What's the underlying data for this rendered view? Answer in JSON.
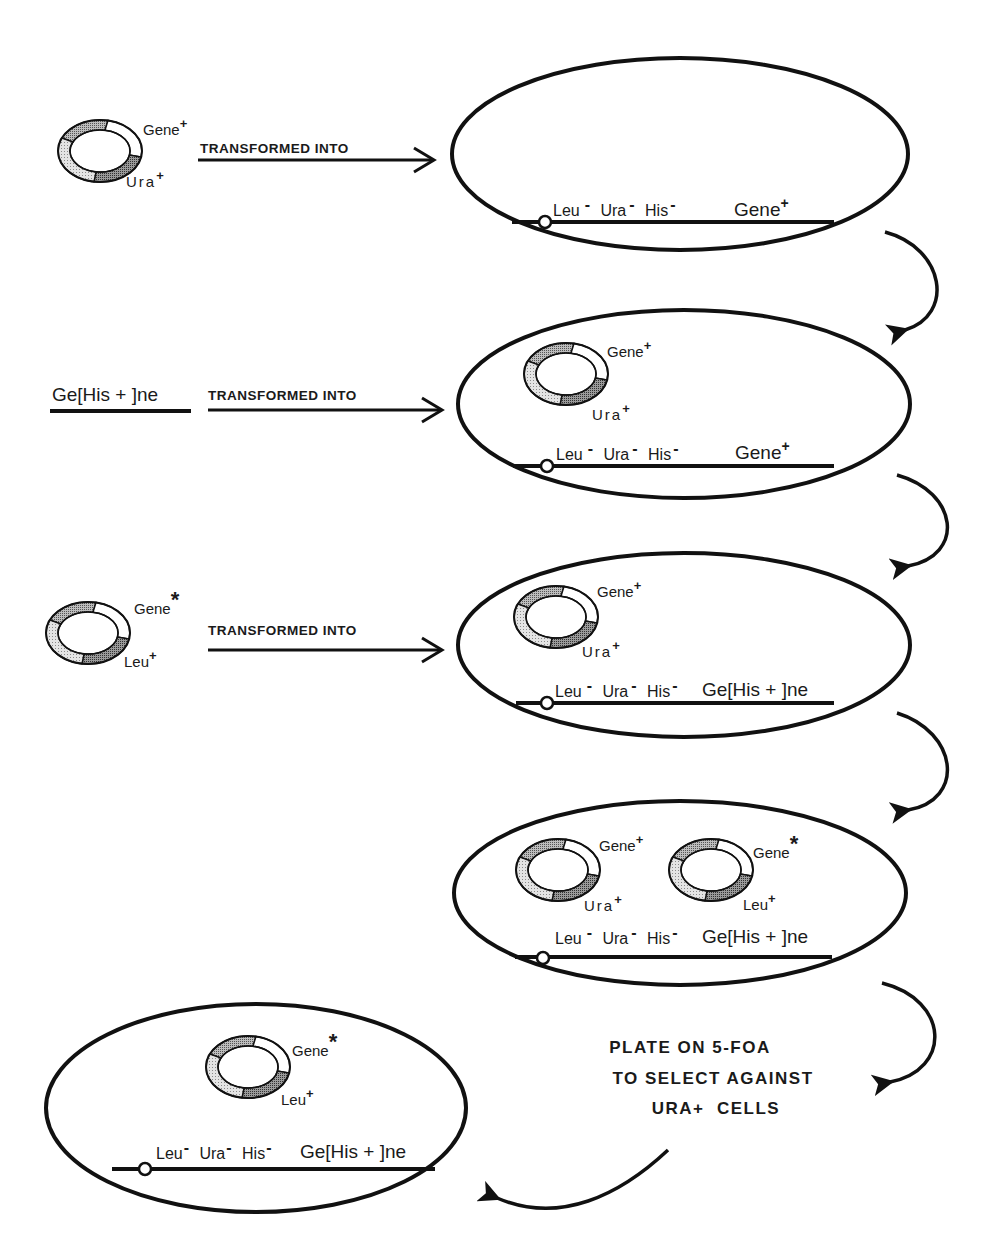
{
  "diagram": {
    "colors": {
      "ink": "#111111",
      "background": "#ffffff",
      "stipple_light": "#cfcfcf",
      "stipple_dark": "#6a6a6a"
    },
    "steps": [
      {
        "id": "step1",
        "input": {
          "type": "plasmid",
          "labels": {
            "top": "Gene",
            "top_sup": "+",
            "bottom": "Ura",
            "bottom_sup": "+"
          }
        },
        "arrow_label": "TRANSFORMED INTO",
        "cell": {
          "plasmids": [],
          "chromosome": {
            "markers": [
              {
                "name": "Leu",
                "sup": "-"
              },
              {
                "name": "Ura",
                "sup": "-"
              },
              {
                "name": "His",
                "sup": "-"
              }
            ],
            "gene": "Gene",
            "gene_sup": "+"
          }
        }
      },
      {
        "id": "step2",
        "input": {
          "type": "linear_dna",
          "label": "Ge[His + ]ne"
        },
        "arrow_label": "TRANSFORMED INTO",
        "cell": {
          "plasmids": [
            {
              "top": "Gene",
              "top_sup": "+",
              "bottom": "Ura",
              "bottom_sup": "+"
            }
          ],
          "chromosome": {
            "markers": [
              {
                "name": "Leu",
                "sup": "-"
              },
              {
                "name": "Ura",
                "sup": "-"
              },
              {
                "name": "His",
                "sup": "-"
              }
            ],
            "gene": "Gene",
            "gene_sup": "+"
          }
        }
      },
      {
        "id": "step3",
        "input": {
          "type": "plasmid",
          "labels": {
            "top": "Gene",
            "top_sup": "*",
            "bottom": "Leu",
            "bottom_sup": "+"
          }
        },
        "arrow_label": "TRANSFORMED INTO",
        "cell": {
          "plasmids": [
            {
              "top": "Gene",
              "top_sup": "+",
              "bottom": "Ura",
              "bottom_sup": "+"
            }
          ],
          "chromosome": {
            "markers": [
              {
                "name": "Leu",
                "sup": "-"
              },
              {
                "name": "Ura",
                "sup": "-"
              },
              {
                "name": "His",
                "sup": "-"
              }
            ],
            "gene": "Ge[His + ]ne"
          }
        }
      },
      {
        "id": "step4",
        "cell": {
          "plasmids": [
            {
              "top": "Gene",
              "top_sup": "+",
              "bottom": "Ura",
              "bottom_sup": "+"
            },
            {
              "top": "Gene",
              "top_sup": "*",
              "bottom": "Leu",
              "bottom_sup": "+"
            }
          ],
          "chromosome": {
            "markers": [
              {
                "name": "Leu",
                "sup": "-"
              },
              {
                "name": "Ura",
                "sup": "-"
              },
              {
                "name": "His",
                "sup": "-"
              }
            ],
            "gene": "Ge[His + ]ne"
          }
        }
      },
      {
        "id": "step5",
        "selection_text": [
          "PLATE ON 5-FOA",
          "TO SELECT AGAINST",
          "URA+  CELLS"
        ],
        "cell": {
          "plasmids": [
            {
              "top": "Gene",
              "top_sup": "*",
              "bottom": "Leu",
              "bottom_sup": "+"
            }
          ],
          "chromosome": {
            "markers": [
              {
                "name": "Leu",
                "sup": "-"
              },
              {
                "name": "Ura",
                "sup": "-"
              },
              {
                "name": "His",
                "sup": "-"
              }
            ],
            "gene": "Ge[His + ]ne"
          }
        }
      }
    ]
  }
}
